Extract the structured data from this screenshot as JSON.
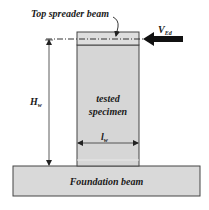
{
  "diagram": {
    "labels": {
      "top_spreader_beam": "Top spreader beam",
      "force_symbol": "V",
      "force_subscript": "Ed",
      "height_symbol": "H",
      "height_subscript": "w",
      "length_symbol": "l",
      "length_subscript": "w",
      "specimen_line1": "tested",
      "specimen_line2": "specimen",
      "foundation_beam": "Foundation beam"
    },
    "colors": {
      "fill": "#d9d9d9",
      "spreader_fill": "#dcdcdc",
      "outline": "#333333",
      "arrow": "#111111"
    }
  }
}
